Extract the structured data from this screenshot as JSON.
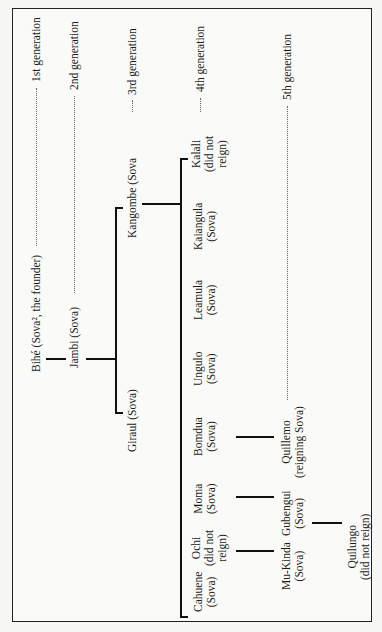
{
  "diagram": {
    "generations": [
      {
        "label": "1st generation"
      },
      {
        "label": "2nd generation"
      },
      {
        "label": "3rd generation"
      },
      {
        "label": "4th generation"
      },
      {
        "label": "5th generation"
      }
    ],
    "nodes": {
      "bihe": {
        "line1": "Bihé (Sova², the founder)"
      },
      "jambi": {
        "line1": "Jambi (Sova)"
      },
      "giraul": {
        "line1": "Giraul (Sova)"
      },
      "kangombe": {
        "line1": "Kangombe (Sova"
      },
      "kalali": {
        "line1": "Kalali",
        "line2": "(did not",
        "line3": "reign)"
      },
      "kaiangula": {
        "line1": "Kaiangula",
        "line2": "(Sova)"
      },
      "leamula": {
        "line1": "Leamula",
        "line2": "(Sova)"
      },
      "ungulo": {
        "line1": "Ungulo",
        "line2": "(Sova)"
      },
      "bomdua": {
        "line1": "Bomdua",
        "line2": "(Sova)"
      },
      "moma": {
        "line1": "Moma",
        "line2": "(Sova)"
      },
      "ochi": {
        "line1": "Ochi",
        "line2": "(did not",
        "line3": "reign)"
      },
      "cahuene": {
        "line1": "Cahuene",
        "line2": "(Sova)"
      },
      "quillemo": {
        "line1": "Quillemo",
        "line2": "(reigning Sova)"
      },
      "gubengui": {
        "line1": "Gubengui",
        "line2": "(Sova)"
      },
      "mukinda": {
        "line1": "Mu-Kinda",
        "line2": "(Sova)"
      },
      "quilungo": {
        "line1": "Quilungo",
        "line2": "(did not reign)"
      }
    }
  }
}
